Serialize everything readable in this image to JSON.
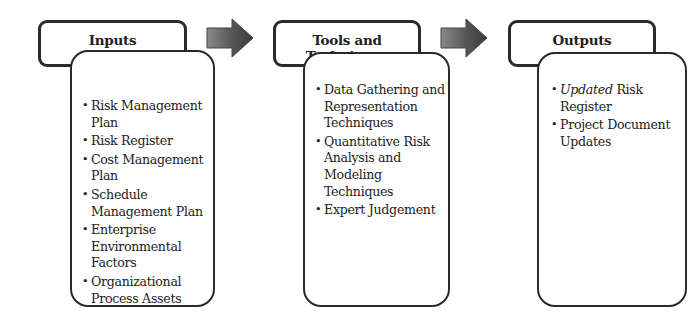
{
  "columns": [
    {
      "title": "Inputs",
      "items": [
        {
          "text": "Risk Management Plan"
        },
        {
          "text": "Risk Register"
        },
        {
          "text": "Cost Management Plan"
        },
        {
          "text": "Schedule Management Plan"
        },
        {
          "text": "Enterprise Environmental Factors"
        },
        {
          "text": "Organizational Process Assets"
        }
      ]
    },
    {
      "title": "Tools and Techniques",
      "items": [
        {
          "text": "Data Gathering and Representation Techniques"
        },
        {
          "text": "Quantitative Risk Analysis and Modeling Techniques"
        },
        {
          "text": "Expert Judgement"
        }
      ]
    },
    {
      "title": "Outputs",
      "items": [
        {
          "italic": "Updated",
          "text": " Risk Register"
        },
        {
          "text": "Project Document Updates"
        }
      ]
    }
  ],
  "arrows": [
    {
      "icon": "right-arrow-icon",
      "from": "Inputs",
      "to": "Tools and Techniques"
    },
    {
      "icon": "right-arrow-icon",
      "from": "Tools and Techniques",
      "to": "Outputs"
    }
  ],
  "colors": {
    "border": "#2a2a2a",
    "arrow_dark": "#3a3a3a",
    "arrow_light": "#8a8a8a"
  }
}
